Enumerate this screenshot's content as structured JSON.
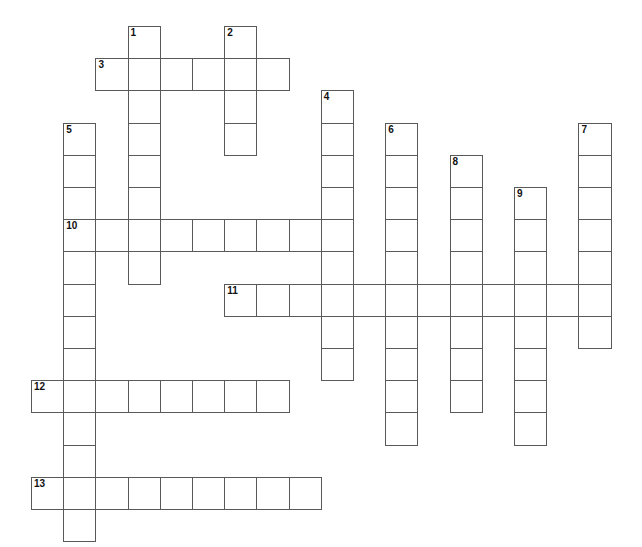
{
  "puzzle": {
    "title": "Crossword Puzzle Grid",
    "type": "crossword-grid",
    "cell_size": 32.2,
    "origin_x": 31,
    "origin_y": 26,
    "grid_colors": {
      "cell_background": "#ffffff",
      "cell_border": "#595959",
      "page_background": "#ffffff",
      "number_color": "#111111"
    },
    "numbers": [
      "1",
      "2",
      "3",
      "4",
      "5",
      "6",
      "7",
      "8",
      "9",
      "10",
      "11",
      "12",
      "13"
    ],
    "entries": [
      {
        "number": "1",
        "direction": "down",
        "col": 3,
        "row": 0,
        "length": 8
      },
      {
        "number": "2",
        "direction": "down",
        "col": 6,
        "row": 0,
        "length": 4
      },
      {
        "number": "3",
        "direction": "across",
        "col": 2,
        "row": 1,
        "length": 6
      },
      {
        "number": "4",
        "direction": "down",
        "col": 9,
        "row": 2,
        "length": 9
      },
      {
        "number": "5",
        "direction": "down",
        "col": 1,
        "row": 3,
        "length": 12
      },
      {
        "number": "6",
        "direction": "down",
        "col": 11,
        "row": 3,
        "length": 10
      },
      {
        "number": "7",
        "direction": "down",
        "col": 17,
        "row": 3,
        "length": 7
      },
      {
        "number": "8",
        "direction": "down",
        "col": 13,
        "row": 4,
        "length": 8
      },
      {
        "number": "9",
        "direction": "down",
        "col": 15,
        "row": 5,
        "length": 8
      },
      {
        "number": "10",
        "direction": "across",
        "col": 1,
        "row": 6,
        "length": 9
      },
      {
        "number": "11",
        "direction": "across",
        "col": 6,
        "row": 8,
        "length": 12
      },
      {
        "number": "12",
        "direction": "across",
        "col": 0,
        "row": 11,
        "length": 8
      },
      {
        "number": "13",
        "direction": "across",
        "col": 0,
        "row": 14,
        "length": 9
      }
    ],
    "cells": [
      {
        "col": 3,
        "row": 0,
        "num": "1"
      },
      {
        "col": 6,
        "row": 0,
        "num": "2"
      },
      {
        "col": 2,
        "row": 1,
        "num": "3"
      },
      {
        "col": 3,
        "row": 1,
        "num": ""
      },
      {
        "col": 4,
        "row": 1,
        "num": ""
      },
      {
        "col": 5,
        "row": 1,
        "num": ""
      },
      {
        "col": 6,
        "row": 1,
        "num": ""
      },
      {
        "col": 7,
        "row": 1,
        "num": ""
      },
      {
        "col": 3,
        "row": 2,
        "num": ""
      },
      {
        "col": 6,
        "row": 2,
        "num": ""
      },
      {
        "col": 9,
        "row": 2,
        "num": "4"
      },
      {
        "col": 3,
        "row": 3,
        "num": ""
      },
      {
        "col": 6,
        "row": 3,
        "num": ""
      },
      {
        "col": 1,
        "row": 3,
        "num": "5"
      },
      {
        "col": 9,
        "row": 3,
        "num": ""
      },
      {
        "col": 11,
        "row": 3,
        "num": "6"
      },
      {
        "col": 17,
        "row": 3,
        "num": "7"
      },
      {
        "col": 1,
        "row": 4,
        "num": ""
      },
      {
        "col": 3,
        "row": 4,
        "num": ""
      },
      {
        "col": 9,
        "row": 4,
        "num": ""
      },
      {
        "col": 11,
        "row": 4,
        "num": ""
      },
      {
        "col": 13,
        "row": 4,
        "num": "8"
      },
      {
        "col": 17,
        "row": 4,
        "num": ""
      },
      {
        "col": 1,
        "row": 5,
        "num": ""
      },
      {
        "col": 3,
        "row": 5,
        "num": ""
      },
      {
        "col": 9,
        "row": 5,
        "num": ""
      },
      {
        "col": 11,
        "row": 5,
        "num": ""
      },
      {
        "col": 13,
        "row": 5,
        "num": ""
      },
      {
        "col": 15,
        "row": 5,
        "num": "9"
      },
      {
        "col": 17,
        "row": 5,
        "num": ""
      },
      {
        "col": 1,
        "row": 6,
        "num": "10"
      },
      {
        "col": 2,
        "row": 6,
        "num": ""
      },
      {
        "col": 3,
        "row": 6,
        "num": ""
      },
      {
        "col": 4,
        "row": 6,
        "num": ""
      },
      {
        "col": 5,
        "row": 6,
        "num": ""
      },
      {
        "col": 6,
        "row": 6,
        "num": ""
      },
      {
        "col": 7,
        "row": 6,
        "num": ""
      },
      {
        "col": 8,
        "row": 6,
        "num": ""
      },
      {
        "col": 9,
        "row": 6,
        "num": ""
      },
      {
        "col": 11,
        "row": 6,
        "num": ""
      },
      {
        "col": 13,
        "row": 6,
        "num": ""
      },
      {
        "col": 15,
        "row": 6,
        "num": ""
      },
      {
        "col": 17,
        "row": 6,
        "num": ""
      },
      {
        "col": 1,
        "row": 7,
        "num": ""
      },
      {
        "col": 3,
        "row": 7,
        "num": ""
      },
      {
        "col": 9,
        "row": 7,
        "num": ""
      },
      {
        "col": 11,
        "row": 7,
        "num": ""
      },
      {
        "col": 13,
        "row": 7,
        "num": ""
      },
      {
        "col": 15,
        "row": 7,
        "num": ""
      },
      {
        "col": 17,
        "row": 7,
        "num": ""
      },
      {
        "col": 1,
        "row": 8,
        "num": ""
      },
      {
        "col": 6,
        "row": 8,
        "num": "11"
      },
      {
        "col": 7,
        "row": 8,
        "num": ""
      },
      {
        "col": 8,
        "row": 8,
        "num": ""
      },
      {
        "col": 9,
        "row": 8,
        "num": ""
      },
      {
        "col": 10,
        "row": 8,
        "num": ""
      },
      {
        "col": 11,
        "row": 8,
        "num": ""
      },
      {
        "col": 12,
        "row": 8,
        "num": ""
      },
      {
        "col": 13,
        "row": 8,
        "num": ""
      },
      {
        "col": 14,
        "row": 8,
        "num": ""
      },
      {
        "col": 15,
        "row": 8,
        "num": ""
      },
      {
        "col": 16,
        "row": 8,
        "num": ""
      },
      {
        "col": 17,
        "row": 8,
        "num": ""
      },
      {
        "col": 1,
        "row": 9,
        "num": ""
      },
      {
        "col": 9,
        "row": 9,
        "num": ""
      },
      {
        "col": 11,
        "row": 9,
        "num": ""
      },
      {
        "col": 13,
        "row": 9,
        "num": ""
      },
      {
        "col": 15,
        "row": 9,
        "num": ""
      },
      {
        "col": 17,
        "row": 9,
        "num": ""
      },
      {
        "col": 1,
        "row": 10,
        "num": ""
      },
      {
        "col": 9,
        "row": 10,
        "num": ""
      },
      {
        "col": 11,
        "row": 10,
        "num": ""
      },
      {
        "col": 13,
        "row": 10,
        "num": ""
      },
      {
        "col": 15,
        "row": 10,
        "num": ""
      },
      {
        "col": 0,
        "row": 11,
        "num": "12"
      },
      {
        "col": 1,
        "row": 11,
        "num": ""
      },
      {
        "col": 2,
        "row": 11,
        "num": ""
      },
      {
        "col": 3,
        "row": 11,
        "num": ""
      },
      {
        "col": 4,
        "row": 11,
        "num": ""
      },
      {
        "col": 5,
        "row": 11,
        "num": ""
      },
      {
        "col": 6,
        "row": 11,
        "num": ""
      },
      {
        "col": 7,
        "row": 11,
        "num": ""
      },
      {
        "col": 11,
        "row": 11,
        "num": ""
      },
      {
        "col": 13,
        "row": 11,
        "num": ""
      },
      {
        "col": 15,
        "row": 11,
        "num": ""
      },
      {
        "col": 1,
        "row": 12,
        "num": ""
      },
      {
        "col": 11,
        "row": 12,
        "num": ""
      },
      {
        "col": 15,
        "row": 12,
        "num": ""
      },
      {
        "col": 1,
        "row": 13,
        "num": ""
      },
      {
        "col": 0,
        "row": 14,
        "num": "13"
      },
      {
        "col": 1,
        "row": 14,
        "num": ""
      },
      {
        "col": 2,
        "row": 14,
        "num": ""
      },
      {
        "col": 3,
        "row": 14,
        "num": ""
      },
      {
        "col": 4,
        "row": 14,
        "num": ""
      },
      {
        "col": 5,
        "row": 14,
        "num": ""
      },
      {
        "col": 6,
        "row": 14,
        "num": ""
      },
      {
        "col": 7,
        "row": 14,
        "num": ""
      },
      {
        "col": 8,
        "row": 14,
        "num": ""
      },
      {
        "col": 1,
        "row": 15,
        "num": ""
      }
    ]
  }
}
